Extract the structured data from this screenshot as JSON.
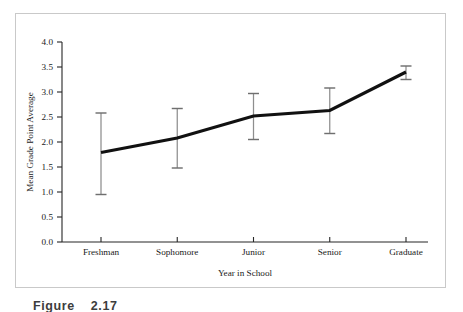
{
  "figure": {
    "caption_label": "Figure",
    "caption_number": "2.17"
  },
  "chart_data": {
    "type": "line",
    "title": "",
    "subtitle": "",
    "xlabel": "Year in School",
    "ylabel": "Mean Grade Point Average",
    "categories": [
      "Freshman",
      "Sophomore",
      "Junior",
      "Senior",
      "Graduate"
    ],
    "values": [
      1.79,
      2.08,
      2.52,
      2.63,
      3.4
    ],
    "error_upper": [
      2.58,
      2.67,
      2.97,
      3.08,
      3.52
    ],
    "error_lower": [
      0.95,
      1.48,
      2.05,
      2.17,
      3.25
    ],
    "series": [
      {
        "name": "Mean Grade Point Average",
        "values": [
          1.79,
          2.08,
          2.52,
          2.63,
          3.4
        ],
        "error_upper": [
          2.58,
          2.67,
          2.97,
          3.08,
          3.52
        ],
        "error_lower": [
          0.95,
          1.48,
          2.05,
          2.17,
          3.25
        ]
      }
    ],
    "ylim": [
      0.0,
      4.0
    ],
    "ytick_values": [
      0.0,
      0.5,
      1.0,
      1.5,
      2.0,
      2.5,
      3.0,
      3.5,
      4.0
    ],
    "ytick_labels": [
      "0.0",
      "0.5",
      "1.0",
      "1.5",
      "2.0",
      "2.5",
      "3.0",
      "3.5",
      "4.0"
    ],
    "xtick_labels": [
      "Freshman",
      "Sophomore",
      "Junior",
      "Senior",
      "Graduate"
    ],
    "grid": false,
    "legend": false,
    "legend_position": "none",
    "error_bar_style": "capped-vertical",
    "line_color": "#111111",
    "error_bar_color": "#8e8e8e",
    "axis_color": "#262626",
    "background_color": "#ffffff",
    "frame_border_color": "#c9c9c9"
  }
}
